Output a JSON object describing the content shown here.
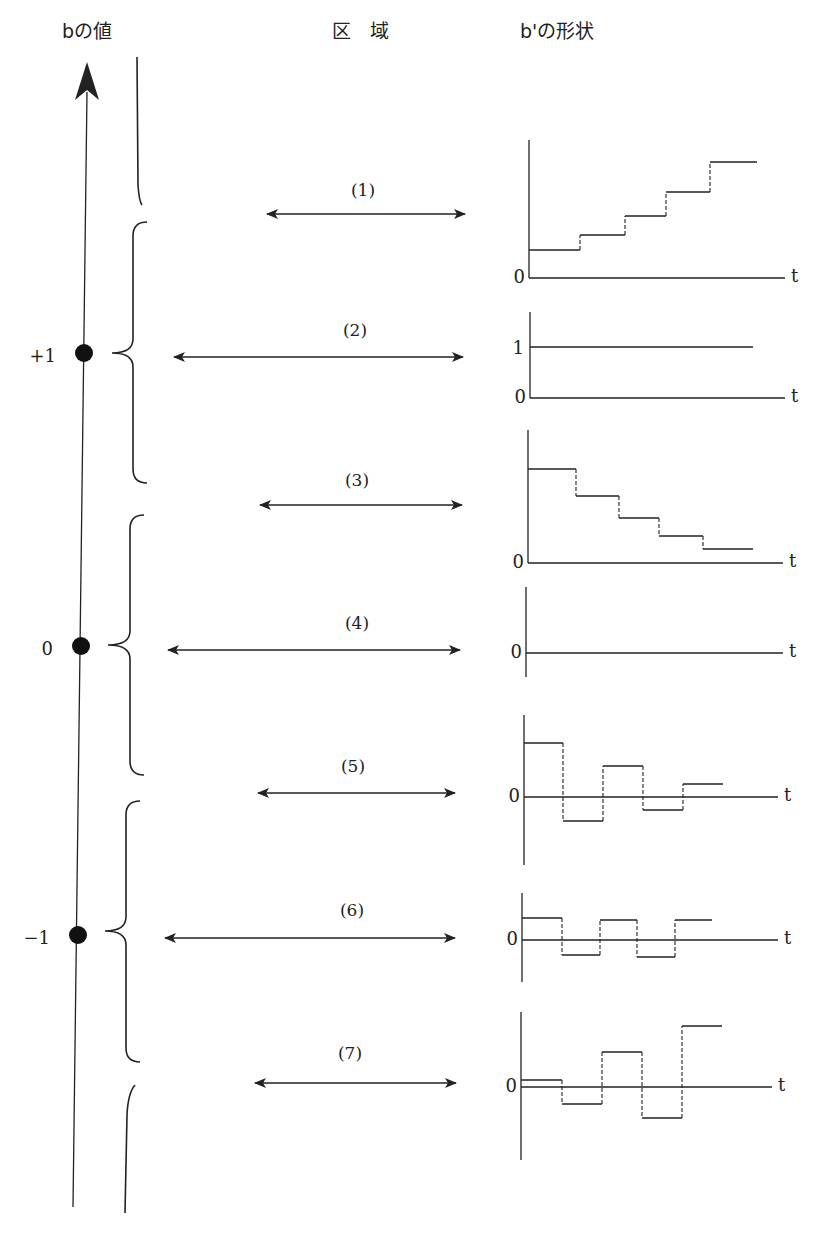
{
  "headers": {
    "b_value": "bの値",
    "region": "区　域",
    "b_prime_shape": "b'の形状"
  },
  "axis": {
    "top": [
      87,
      62
    ],
    "bottom": [
      73,
      1207
    ],
    "points": [
      {
        "label": "+1",
        "x": 84,
        "y": 353
      },
      {
        "label": "0",
        "x": 81,
        "y": 646
      },
      {
        "label": "−1",
        "x": 78,
        "y": 935
      }
    ]
  },
  "braces": [
    {
      "type": "partial-top",
      "top": 57,
      "bottom": 205,
      "x": 140
    },
    {
      "type": "full",
      "top": 222,
      "bottom": 483,
      "x": 147,
      "tip": [
        112,
        353
      ]
    },
    {
      "type": "full",
      "top": 515,
      "bottom": 775,
      "x": 144,
      "tip": [
        108,
        645
      ]
    },
    {
      "type": "full",
      "top": 801,
      "bottom": 1062,
      "x": 140,
      "tip": [
        105,
        931
      ]
    },
    {
      "type": "partial-bottom",
      "top": 1085,
      "bottom": 1213,
      "x": 128
    }
  ],
  "regions": [
    {
      "label": "(1)",
      "x1": 267,
      "x2": 465,
      "y": 214,
      "lx": 363,
      "ly": 190
    },
    {
      "label": "(2)",
      "x1": 174,
      "x2": 463,
      "y": 357,
      "lx": 355,
      "ly": 330
    },
    {
      "label": "(3)",
      "x1": 260,
      "x2": 462,
      "y": 505,
      "lx": 357,
      "ly": 480
    },
    {
      "label": "(4)",
      "x1": 168,
      "x2": 460,
      "y": 650,
      "lx": 357,
      "ly": 623
    },
    {
      "label": "(5)",
      "x1": 258,
      "x2": 455,
      "y": 793,
      "lx": 353,
      "ly": 766
    },
    {
      "label": "(6)",
      "x1": 165,
      "x2": 455,
      "y": 938,
      "lx": 352,
      "ly": 910
    },
    {
      "label": "(7)",
      "x1": 255,
      "x2": 456,
      "y": 1083,
      "lx": 350,
      "ly": 1053
    }
  ],
  "chart_data": [
    {
      "type": "line",
      "title": "(1)",
      "description": "monotonically increasing step response",
      "axis_x": 529,
      "axis_top": 140,
      "axis_bottom": 278,
      "baseline": 278,
      "baseline_end": 785,
      "zero_label": "0",
      "t_label": "t",
      "extra_labels": [],
      "steps": [
        [
          529,
          580,
          250
        ],
        [
          580,
          625,
          235
        ],
        [
          625,
          666,
          216
        ],
        [
          666,
          710,
          192
        ],
        [
          710,
          757,
          162
        ]
      ]
    },
    {
      "type": "line",
      "title": "(2)",
      "description": "constant at 1",
      "axis_x": 530,
      "axis_top": 312,
      "axis_bottom": 398,
      "baseline": 398,
      "baseline_end": 785,
      "zero_label": "0",
      "t_label": "t",
      "extra_labels": [
        {
          "text": "1",
          "y": 347
        }
      ],
      "steps": [
        [
          530,
          753,
          347
        ]
      ]
    },
    {
      "type": "line",
      "title": "(3)",
      "description": "monotonically decreasing positive steps",
      "axis_x": 528,
      "axis_top": 430,
      "axis_bottom": 563,
      "baseline": 563,
      "baseline_end": 783,
      "zero_label": "0",
      "t_label": "t",
      "extra_labels": [],
      "steps": [
        [
          528,
          576,
          469
        ],
        [
          576,
          619,
          496
        ],
        [
          619,
          659,
          518
        ],
        [
          659,
          703,
          536
        ],
        [
          703,
          753,
          549
        ]
      ]
    },
    {
      "type": "line",
      "title": "(4)",
      "description": "identically zero",
      "axis_x": 526,
      "axis_top": 587,
      "axis_bottom": 677,
      "baseline": 653,
      "baseline_end": 783,
      "zero_label": "0",
      "t_label": "t",
      "extra_labels": [],
      "steps": []
    },
    {
      "type": "line",
      "title": "(5)",
      "description": "damped alternating oscillation",
      "axis_x": 524,
      "axis_top": 715,
      "axis_bottom": 865,
      "baseline": 797,
      "baseline_end": 778,
      "zero_label": "0",
      "t_label": "t",
      "extra_labels": [],
      "steps": [
        [
          524,
          563,
          743
        ],
        [
          563,
          603,
          821
        ],
        [
          603,
          643,
          766
        ],
        [
          643,
          683,
          810
        ],
        [
          683,
          723,
          784
        ]
      ]
    },
    {
      "type": "line",
      "title": "(6)",
      "description": "sustained alternating oscillation, constant amplitude",
      "axis_x": 522,
      "axis_top": 893,
      "axis_bottom": 982,
      "baseline": 940,
      "baseline_end": 778,
      "zero_label": "0",
      "t_label": "t",
      "extra_labels": [],
      "steps": [
        [
          522,
          562,
          918
        ],
        [
          562,
          600,
          955
        ],
        [
          600,
          637,
          920
        ],
        [
          637,
          675,
          957
        ],
        [
          675,
          712,
          920
        ]
      ]
    },
    {
      "type": "line",
      "title": "(7)",
      "description": "growing alternating oscillation",
      "axis_x": 521,
      "axis_top": 1012,
      "axis_bottom": 1160,
      "baseline": 1087,
      "baseline_end": 772,
      "zero_label": "0",
      "t_label": "t",
      "extra_labels": [],
      "steps": [
        [
          521,
          562,
          1080
        ],
        [
          562,
          602,
          1104
        ],
        [
          602,
          642,
          1052
        ],
        [
          642,
          682,
          1118
        ],
        [
          682,
          722,
          1026
        ]
      ]
    }
  ]
}
